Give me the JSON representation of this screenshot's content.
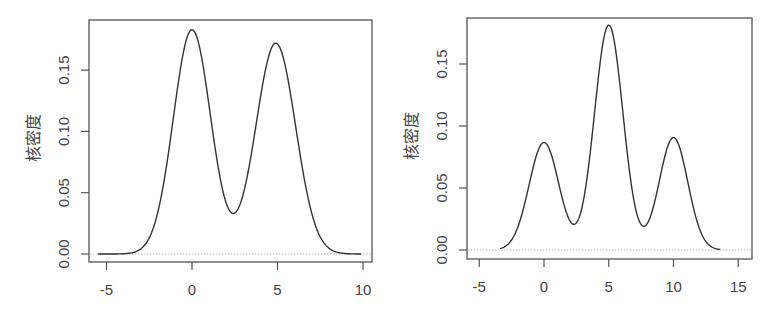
{
  "chart_data": [
    {
      "type": "line",
      "title": "",
      "xlabel": "",
      "ylabel": "核密度",
      "xlim": [
        -6,
        10.5
      ],
      "ylim": [
        -0.007,
        0.188
      ],
      "xticks": [
        -5,
        0,
        5,
        10
      ],
      "xtick_labels": [
        "-5",
        "0",
        "5",
        "10"
      ],
      "yticks": [
        0.0,
        0.05,
        0.1,
        0.15
      ],
      "ytick_labels": [
        "0.00",
        "0.05",
        "0.10",
        "0.15"
      ],
      "grid": false,
      "legend": null,
      "x_range_curve": [
        -5.5,
        9.9
      ],
      "components": [
        {
          "mean": 0.0,
          "sd": 1.09,
          "weight": 0.5
        },
        {
          "mean": 4.9,
          "sd": 1.16,
          "weight": 0.5
        }
      ],
      "key_points": [
        {
          "x": 0.0,
          "y": 0.183,
          "label": "peak"
        },
        {
          "x": 2.6,
          "y": 0.035,
          "label": "trough"
        },
        {
          "x": 4.9,
          "y": 0.172,
          "label": "peak"
        }
      ],
      "frame_px": {
        "left": 89,
        "top": 20,
        "right": 372,
        "bottom": 262
      },
      "map_px": {
        "x0": 192,
        "x_per_unit": 17.1,
        "y0": 254,
        "y_per_unit": 1226
      }
    },
    {
      "type": "line",
      "title": "",
      "xlabel": "",
      "ylabel": "核密度",
      "xlim": [
        -6,
        16
      ],
      "ylim": [
        -0.006,
        0.187
      ],
      "xticks": [
        -5,
        0,
        5,
        10,
        15
      ],
      "xtick_labels": [
        "-5",
        "0",
        "5",
        "10",
        "15"
      ],
      "yticks": [
        0.0,
        0.05,
        0.1,
        0.15
      ],
      "ytick_labels": [
        "0.00",
        "0.05",
        "0.10",
        "0.15"
      ],
      "grid": false,
      "legend": null,
      "x_range_curve": [
        -3.4,
        13.6
      ],
      "components": [
        {
          "mean": 0.0,
          "sd": 1.15,
          "weight": 0.25
        },
        {
          "mean": 5.0,
          "sd": 1.1,
          "weight": 0.5
        },
        {
          "mean": 10.0,
          "sd": 1.1,
          "weight": 0.25
        }
      ],
      "key_points": [
        {
          "x": 0.0,
          "y": 0.085,
          "label": "peak"
        },
        {
          "x": 2.3,
          "y": 0.02,
          "label": "trough"
        },
        {
          "x": 5.0,
          "y": 0.18,
          "label": "peak"
        },
        {
          "x": 7.7,
          "y": 0.023,
          "label": "trough"
        },
        {
          "x": 10.0,
          "y": 0.09,
          "label": "peak"
        }
      ],
      "frame_px": {
        "left": 467,
        "top": 18,
        "right": 752,
        "bottom": 259
      },
      "map_px": {
        "x0": 544,
        "x_per_unit": 12.95,
        "y0": 250,
        "y_per_unit": 1240
      }
    }
  ]
}
